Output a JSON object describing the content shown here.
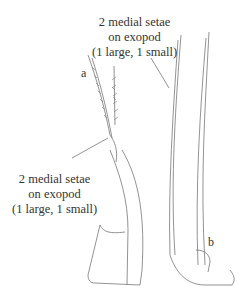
{
  "figure": {
    "annotations": [
      {
        "id": "top",
        "lines": [
          "2 medial setae",
          "on exopod",
          "(1 large, 1 small)"
        ]
      },
      {
        "id": "bottom",
        "lines": [
          "2 medial setae",
          "on exopod",
          "(1 large, 1 small)"
        ]
      }
    ],
    "panel_labels": {
      "a": "a",
      "b": "b"
    },
    "line_color": "#666666"
  }
}
